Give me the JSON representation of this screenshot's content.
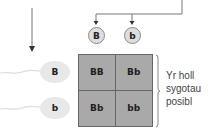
{
  "diagram": {
    "type": "punnett-square",
    "top_gametes": [
      {
        "allele": "B"
      },
      {
        "allele": "b"
      }
    ],
    "side_gametes": [
      {
        "allele": "B"
      },
      {
        "allele": "b"
      }
    ],
    "cells": [
      [
        "BB",
        "Bb"
      ],
      [
        "Bb",
        "bb"
      ]
    ],
    "bracket_label": {
      "lines": [
        "Yr holl",
        "sygotau",
        "posibl"
      ]
    },
    "colors": {
      "grid_fill": "#a9a9a9",
      "grid_lines": "#666666",
      "circle_fill": "#dedede",
      "sperm_fill": "#e8e8e8",
      "arrow": "#555555",
      "text": "#222222"
    }
  }
}
